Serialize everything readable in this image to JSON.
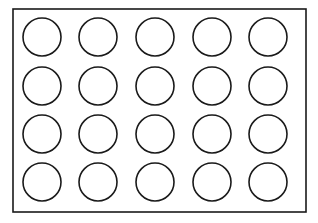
{
  "diagram": {
    "frame": {
      "x": 13,
      "y": 9,
      "width": 293,
      "height": 203,
      "stroke": "#1a1a1a"
    },
    "grid": {
      "rows": 4,
      "cols": 5,
      "col_centers": [
        42,
        98,
        155,
        212,
        268
      ],
      "row_centers": [
        37,
        86,
        134,
        182
      ],
      "radius": 19,
      "stroke": "#1a1a1a"
    }
  }
}
